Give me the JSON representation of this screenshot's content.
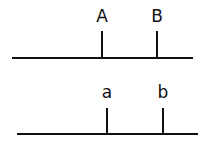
{
  "diagram": {
    "top": {
      "labels": [
        "A",
        "B"
      ]
    },
    "bottom": {
      "labels": [
        "a",
        "b"
      ]
    }
  }
}
